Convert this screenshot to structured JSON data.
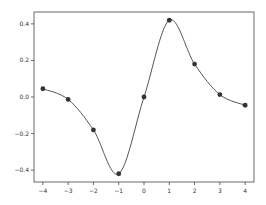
{
  "chart_data": {
    "type": "line",
    "title": "",
    "xlabel": "",
    "ylabel": "",
    "x": [
      -4,
      -3,
      -2,
      -1,
      0,
      1,
      2,
      3,
      4
    ],
    "series": [
      {
        "name": "data",
        "values": [
          0.045,
          -0.013,
          -0.18,
          -0.42,
          0.0,
          0.42,
          0.18,
          0.013,
          -0.045
        ],
        "marker": "circle",
        "line": "smooth"
      }
    ],
    "xlim": [
      -4.35,
      4.35
    ],
    "ylim": [
      -0.465,
      0.465
    ],
    "xticks": [
      -4,
      -3,
      -2,
      -1,
      0,
      1,
      2,
      3,
      4
    ],
    "yticks": [
      0.4,
      0.2,
      0.0,
      -0.2,
      -0.4
    ],
    "xtick_labels": [
      "−4",
      "−3",
      "−2",
      "−1",
      "0",
      "1",
      "2",
      "3",
      "4"
    ],
    "ytick_labels": [
      "0.4",
      "0.2",
      "0.0",
      "−0.2",
      "−0.4"
    ],
    "grid": false,
    "legend": null,
    "colors": {
      "line": "#555555",
      "marker": "#333333",
      "axes": "#444444"
    }
  }
}
